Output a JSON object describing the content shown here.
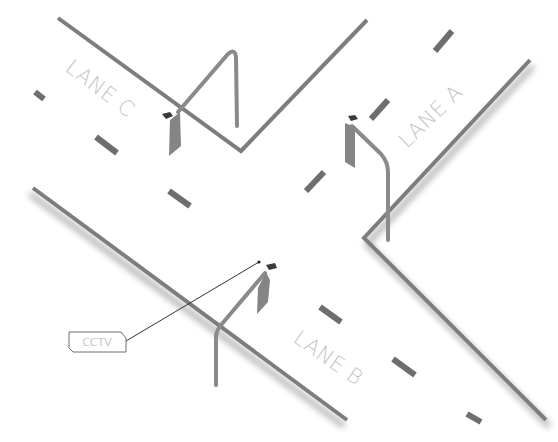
{
  "diagram": {
    "colors": {
      "road_edge": "#7d7d7d",
      "lane_marking": "#6e6e6e",
      "pole": "#8a8a8a",
      "sign": "#858585",
      "camera": "#3a3a3a",
      "label_text": "#c4c4c4",
      "leader_line": "#333333",
      "background": "#ffffff"
    },
    "lanes": [
      {
        "id": "A",
        "label": "LANE A"
      },
      {
        "id": "B",
        "label": "LANE B"
      },
      {
        "id": "C",
        "label": "LANE C"
      }
    ],
    "callout": {
      "label": "CCTV",
      "icon": "camera-icon"
    },
    "cameras": [
      {
        "lane": "C",
        "icon": "cctv-camera-icon"
      },
      {
        "lane": "A",
        "icon": "cctv-camera-icon"
      },
      {
        "lane": "B",
        "icon": "cctv-camera-icon"
      }
    ]
  }
}
